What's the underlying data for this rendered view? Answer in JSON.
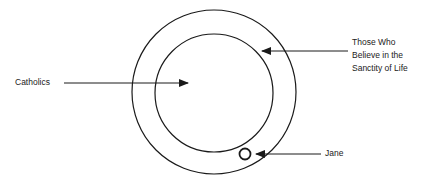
{
  "diagram": {
    "type": "euler",
    "colors": {
      "stroke": "#1a1a1a",
      "background": "#ffffff",
      "text": "#222222"
    },
    "sets": [
      {
        "id": "outer",
        "label": "Those Who Believe in the Sanctity of Life",
        "cx": 214,
        "cy": 92,
        "r": 82
      },
      {
        "id": "inner",
        "label": "Catholics",
        "cx": 214,
        "cy": 93,
        "r": 59
      }
    ],
    "points": [
      {
        "id": "jane",
        "label": "Jane",
        "cx": 245,
        "cy": 154,
        "r": 5.5
      }
    ],
    "labels": {
      "catholics": "Catholics",
      "sanctity_line1": "Those Who",
      "sanctity_line2": "Believe in the",
      "sanctity_line3": "Sanctity of Life",
      "jane": "Jane"
    }
  }
}
